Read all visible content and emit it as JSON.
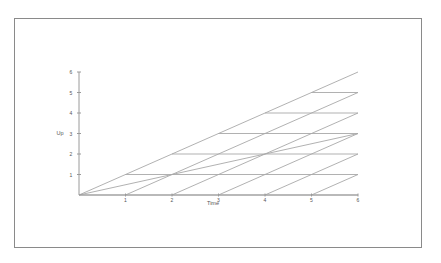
{
  "chart_data": {
    "type": "line",
    "title": "",
    "xlabel": "Time",
    "ylabel": "Up",
    "xlim": [
      0,
      6
    ],
    "ylim": [
      0,
      6
    ],
    "x_ticks": [
      "1",
      "2",
      "3",
      "4",
      "5",
      "6"
    ],
    "y_ticks": [
      "1",
      "2",
      "3",
      "4",
      "5",
      "6"
    ],
    "grid": false,
    "legend": null,
    "series": [
      {
        "name": "diagonal slope 1",
        "x": [
          0,
          6
        ],
        "y": [
          0,
          6
        ]
      },
      {
        "name": "diagonal slope 0.5",
        "x": [
          0,
          6
        ],
        "y": [
          0,
          3
        ]
      },
      {
        "name": "horizontal y=1",
        "x": [
          1,
          6
        ],
        "y": [
          1,
          1
        ]
      },
      {
        "name": "horizontal y=2",
        "x": [
          2,
          6
        ],
        "y": [
          2,
          2
        ]
      },
      {
        "name": "horizontal y=3",
        "x": [
          3,
          6
        ],
        "y": [
          3,
          3
        ]
      },
      {
        "name": "horizontal y=4",
        "x": [
          4,
          6
        ],
        "y": [
          4,
          4
        ]
      },
      {
        "name": "horizontal y=5",
        "x": [
          5,
          6
        ],
        "y": [
          5,
          5
        ]
      },
      {
        "name": "horizontal y=0",
        "x": [
          0,
          6
        ],
        "y": [
          0,
          0
        ]
      },
      {
        "name": "slope 1 from x=1",
        "x": [
          1,
          6
        ],
        "y": [
          0,
          5
        ]
      },
      {
        "name": "slope 1 from x=2",
        "x": [
          2,
          6
        ],
        "y": [
          0,
          4
        ]
      },
      {
        "name": "slope 1 from x=3",
        "x": [
          3,
          6
        ],
        "y": [
          0,
          3
        ]
      },
      {
        "name": "slope 1 from x=4",
        "x": [
          4,
          6
        ],
        "y": [
          0,
          2
        ]
      },
      {
        "name": "slope 1 from x=5",
        "x": [
          5,
          6
        ],
        "y": [
          0,
          1
        ]
      }
    ]
  },
  "colors": {
    "line": "#a8a8a8",
    "axis": "#9a9a9a",
    "frame": "#8a8a8a",
    "text": "#555555"
  }
}
